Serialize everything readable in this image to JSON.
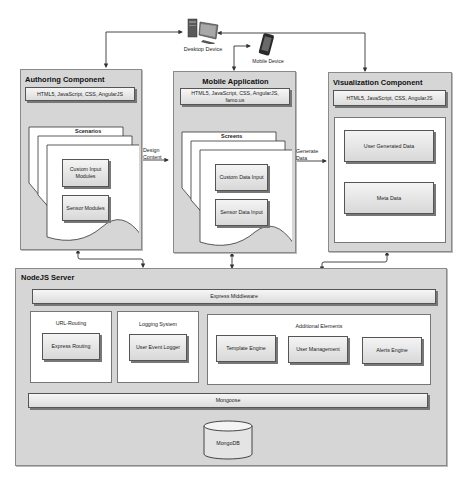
{
  "devices": {
    "desktop": {
      "label": "Desktop Device",
      "icon": "desktop-computer-icon"
    },
    "mobile": {
      "label": "Mobile Device",
      "icon": "smartphone-icon"
    }
  },
  "authoring": {
    "title": "Authoring Component",
    "tech": "HTML5, JavaScript, CSS, AngularJS",
    "stack_title": "Scenarios",
    "modules": [
      "Custom Input Modules",
      "Sensor Modules"
    ]
  },
  "mobile_app": {
    "title": "Mobile Application",
    "tech": "HTML5, JavaScript, CSS, AngularJS, famo.us",
    "stack_title": "Screens",
    "modules": [
      "Custom Data Input",
      "Sensor Data Input"
    ]
  },
  "visualization": {
    "title": "Visualization Component",
    "tech": "HTML5, JavaScript, CSS, AngularJS",
    "modules": [
      "User Generated Data",
      "Meta Data"
    ]
  },
  "flows": {
    "design_content": [
      "Design",
      "Content"
    ],
    "generate_data": [
      "Generate",
      "Data"
    ]
  },
  "server": {
    "title": "NodeJS Server",
    "middleware": "Express Middleware",
    "url_routing": {
      "title": "URL-Routing",
      "module": "Express Routing"
    },
    "logging": {
      "title": "Logging System",
      "module": "User Event Logger"
    },
    "additional": {
      "title": "Additional Elements",
      "modules": [
        "Template Engine",
        "User Management",
        "Alerts Engine"
      ]
    },
    "mongoose": "Mongoose",
    "database": "MongoDB"
  },
  "colors": {
    "panel": "#d6d6d6",
    "panel_border": "#8a8a8a",
    "module_light": "#f4f4f4",
    "module_dark": "#d8d8d8",
    "arrow": "#333333"
  }
}
